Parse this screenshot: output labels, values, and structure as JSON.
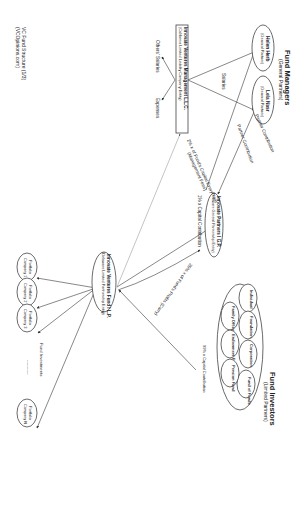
{
  "title": {
    "line1": "VC Fund Structure (1/3)",
    "line2": "(VCOpinions.com)"
  },
  "fund_managers": {
    "heading": "Fund Managers",
    "subheading": "(General Partners)",
    "members": [
      {
        "name": "Helen Herb",
        "role": "(General Partner)"
      },
      {
        "name": "Lela Nasr",
        "role": "(General Partner)"
      }
    ]
  },
  "management_company": {
    "name": "Innovate Ventures Management L.L.C.",
    "type": "(California Limited Liability Company Entity)",
    "outflows": [
      "Others' Salaries",
      "Expenses"
    ]
  },
  "general_partner": {
    "name": "Innovate Partners I G.P.",
    "type": "(Delaware General Partnership Entity)"
  },
  "fund": {
    "name": "Innovate Ventures Fund I L.P.",
    "type": "(Delaware Limited Partnership Entity)"
  },
  "fund_investors": {
    "heading": "Fund Investors",
    "subheading": "(Limited Partners)",
    "types": [
      "Individual",
      "Foundation",
      "Corporation",
      "Fund of Funds",
      "Family Office",
      "Endowment Fund",
      "Pension Fund"
    ]
  },
  "portfolio": {
    "label": "Fund Investments",
    "ellipsis": "-----------",
    "companies": [
      {
        "line1": "Portfolio",
        "line2": "Company 1"
      },
      {
        "line1": "Portfolio",
        "line2": "Company 2"
      },
      {
        "line1": "Portfolio",
        "line2": "Company 3"
      },
      {
        "line1": "Portfolio",
        "line2": "Company N"
      }
    ]
  },
  "flows": {
    "salaries": "Salaries",
    "partner_contribution_1": "Partner Contribution",
    "partner_contribution_2": "Partner Contribution",
    "gp_commit": "1% x Capital Contribution",
    "mgmt_fee_1": "2% x of Fund's Capital Every Year",
    "mgmt_fee_2": "(Management Fees)",
    "carry": "20% x of Fund's Profits (Carry)",
    "lp_commit": "99% x Capital Contribution"
  }
}
